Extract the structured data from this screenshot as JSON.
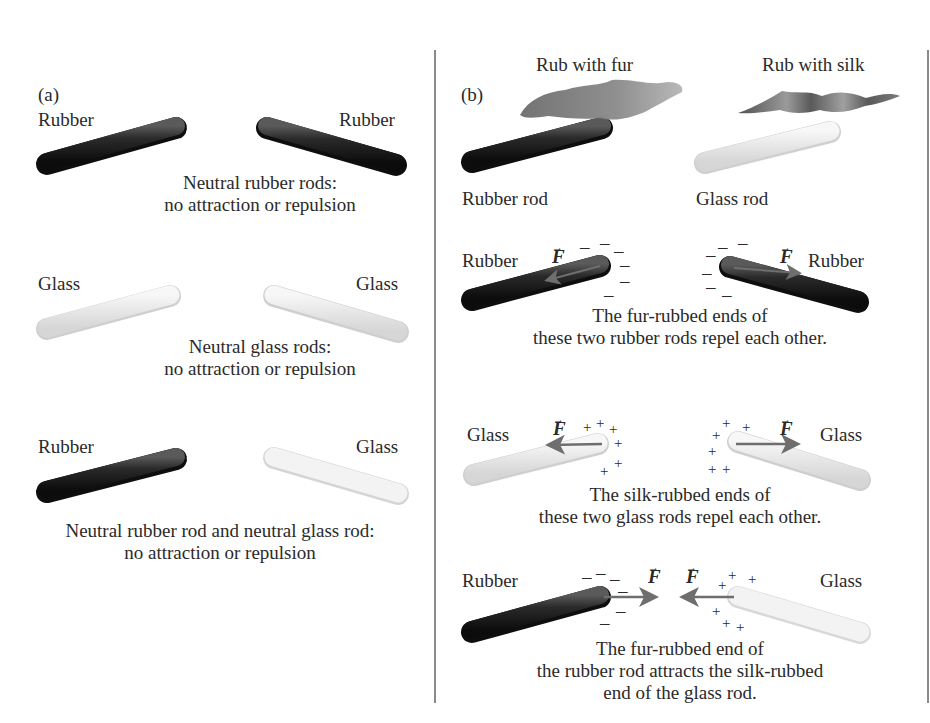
{
  "panel_a": {
    "label": "(a)",
    "row1": {
      "left_label": "Rubber",
      "right_label": "Rubber",
      "caption_line1": "Neutral rubber rods:",
      "caption_line2": "no attraction or repulsion"
    },
    "row2": {
      "left_label": "Glass",
      "right_label": "Glass",
      "caption_line1": "Neutral glass rods:",
      "caption_line2": "no attraction or repulsion"
    },
    "row3": {
      "left_label": "Rubber",
      "right_label": "Glass",
      "caption_line1": "Neutral rubber rod and neutral glass rod:",
      "caption_line2": "no attraction or repulsion"
    }
  },
  "panel_b": {
    "label": "(b)",
    "rub_fur": "Rub with fur",
    "rub_silk": "Rub with silk",
    "rubber_rod": "Rubber rod",
    "glass_rod": "Glass rod",
    "force_symbol": "F",
    "vector_arrow": "→",
    "row1": {
      "left_label": "Rubber",
      "right_label": "Rubber",
      "caption_line1": "The fur-rubbed ends of",
      "caption_line2": "these two rubber rods repel each other."
    },
    "row2": {
      "left_label": "Glass",
      "right_label": "Glass",
      "caption_line1": "The silk-rubbed ends of",
      "caption_line2": "these two glass rods repel each other."
    },
    "row3": {
      "left_label": "Rubber",
      "right_label": "Glass",
      "caption_line1": "The fur-rubbed end of",
      "caption_line2": "the rubber rod attracts the silk-rubbed",
      "caption_line3": "end of the glass rod."
    }
  },
  "charges": {
    "negative": "–",
    "positive": "+"
  },
  "colors": {
    "rubber": "#1a1a1a",
    "glass_fill": "#ececec",
    "glass_edge": "#c8c8c8",
    "fur": "#7a7a7a",
    "silk": "#6a6a6a",
    "arrow": "#6e6e6e",
    "text": "#2a2a2a",
    "divider": "#8a8a8a"
  }
}
